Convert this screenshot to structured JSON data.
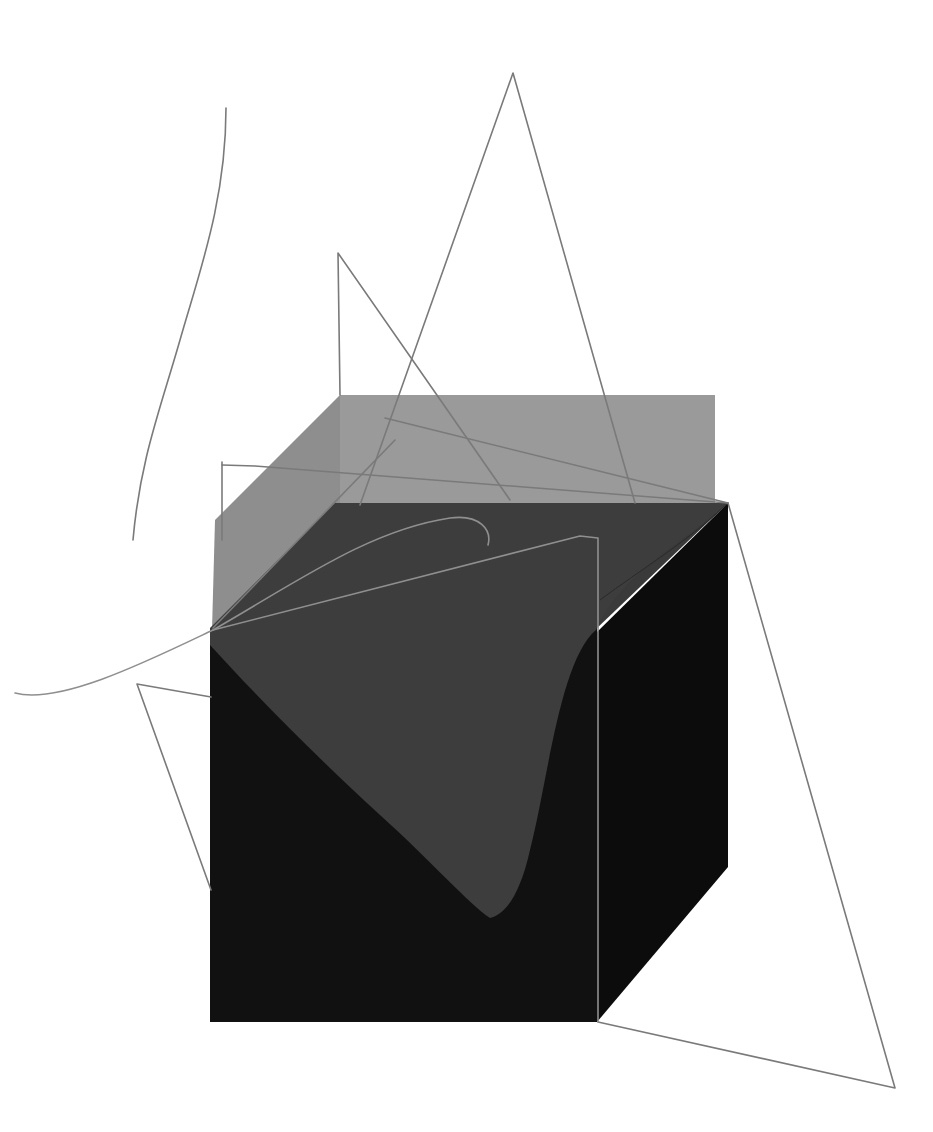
{
  "artwork": {
    "description": "Abstract geometric composition: translucent gray and black cube with overlapping thin gray line figures",
    "background": "#ffffff",
    "colors": {
      "back_face": "#9a9a9a",
      "back_side_face": "#8e8e8e",
      "top_dark_face": "#3a3a3a",
      "front_face": "#111111",
      "right_face": "#0c0c0c",
      "wave_shape": "#3d3d3d",
      "line": "#7a7a7a",
      "light_line": "#8f8f8f"
    }
  }
}
